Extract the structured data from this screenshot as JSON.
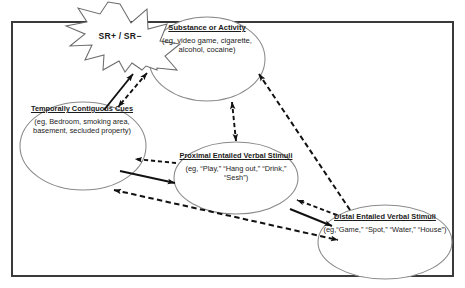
{
  "diagram": {
    "frame": {
      "border_color": "#3a3a3a"
    },
    "burst": {
      "id": "burst-sr",
      "shape": "starburst",
      "label": "SR+ / SR−",
      "stroke": "#555555",
      "fill": "#ffffff"
    },
    "nodes": [
      {
        "id": "substance-activity",
        "title": "Substance or Activity",
        "body": "(eg, video game, cigarette, alcohol, cocaine)",
        "shape": "ellipse"
      },
      {
        "id": "temporally-contiguous-cues",
        "title": "Temporally Contiguous Cues",
        "body": "(eg, Bedroom, smoking area, basement, secluded property)",
        "shape": "ellipse"
      },
      {
        "id": "proximal-entailed-verbal-stimuli",
        "title": "Proximal Entailed Verbal Stimuli",
        "body": "(eg, “Play,” “Hang out,” “Drink,” “Sesh”)",
        "shape": "ellipse"
      },
      {
        "id": "distal-entailed-verbal-stimuli",
        "title": "Distal Entailed Verbal Stimuli",
        "body": "(eg,“Game,” “Spot,” “Water,” “House”)",
        "shape": "ellipse"
      }
    ],
    "connectors": [
      {
        "id": "substance-to-burst",
        "from": "substance-activity",
        "to": "burst-sr",
        "style": "solid",
        "heads": "single"
      },
      {
        "id": "temporal-to-burst",
        "from": "temporally-contiguous-cues",
        "to": "burst-sr",
        "style": "solid",
        "heads": "single"
      },
      {
        "id": "substance-temporal",
        "from": "substance-activity",
        "to": "temporally-contiguous-cues",
        "style": "dashed",
        "heads": "double"
      },
      {
        "id": "substance-proximal",
        "from": "substance-activity",
        "to": "proximal-entailed-verbal-stimuli",
        "style": "dashed",
        "heads": "double"
      },
      {
        "id": "distal-to-substance",
        "from": "distal-entailed-verbal-stimuli",
        "to": "substance-activity",
        "style": "dashed",
        "heads": "double"
      },
      {
        "id": "temporal-proximal-dashed",
        "from": "proximal-entailed-verbal-stimuli",
        "to": "temporally-contiguous-cues",
        "style": "dashed",
        "heads": "single"
      },
      {
        "id": "temporal-proximal-solid",
        "from": "temporally-contiguous-cues",
        "to": "proximal-entailed-verbal-stimuli",
        "style": "solid",
        "heads": "single"
      },
      {
        "id": "proximal-distal-dashed",
        "from": "distal-entailed-verbal-stimuli",
        "to": "proximal-entailed-verbal-stimuli",
        "style": "dashed",
        "heads": "single"
      },
      {
        "id": "proximal-distal-solid",
        "from": "proximal-entailed-verbal-stimuli",
        "to": "distal-entailed-verbal-stimuli",
        "style": "solid",
        "heads": "single"
      },
      {
        "id": "temporal-distal",
        "from": "temporally-contiguous-cues",
        "to": "distal-entailed-verbal-stimuli",
        "style": "dashed",
        "heads": "double"
      }
    ]
  }
}
